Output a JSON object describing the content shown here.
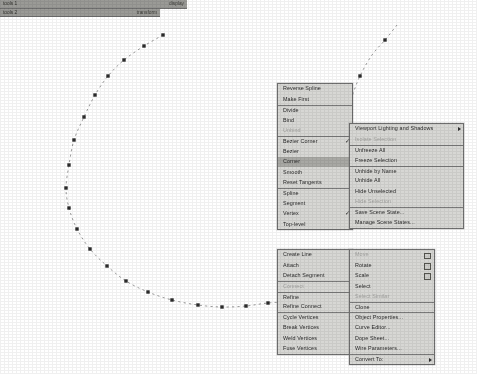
{
  "app": {
    "name": "3ds Max viewport quad menu",
    "background_color": "#ffffff",
    "menu_bg_color": "#d7d7d4",
    "menu_border_color": "#6e6e6e",
    "menu_title_bg_color": "#9a9a96",
    "highlight_color": "#a8a8a4",
    "disabled_text_color": "#a2a29f",
    "text_color": "#2a2a2a",
    "spline_color": "#8e8e8e",
    "vertex_color": "#2b2b2b"
  },
  "viewport": {
    "name": "spline-curve",
    "curve_style": "dashed",
    "vertex_count": 24,
    "vertices": [
      [
        163,
        35
      ],
      [
        144,
        46
      ],
      [
        124,
        60
      ],
      [
        108,
        76
      ],
      [
        95,
        95
      ],
      [
        84,
        117
      ],
      [
        74,
        140
      ],
      [
        69,
        165
      ],
      [
        66,
        188
      ],
      [
        69,
        208
      ],
      [
        77,
        229
      ],
      [
        90,
        249
      ],
      [
        107,
        266
      ],
      [
        126,
        281
      ],
      [
        148,
        292
      ],
      [
        172,
        300
      ],
      [
        198,
        305
      ],
      [
        222,
        307
      ],
      [
        246,
        306
      ],
      [
        268,
        303
      ],
      [
        298,
        301
      ],
      [
        330,
        298
      ],
      [
        360,
        76
      ],
      [
        367,
        55
      ]
    ],
    "upper_branch": [
      [
        397,
        25
      ],
      [
        385,
        40
      ],
      [
        372,
        55
      ],
      [
        360,
        76
      ],
      [
        352,
        97
      ],
      [
        347,
        118
      ]
    ]
  },
  "quad_menus": {
    "upper": {
      "title_left": "tools 1",
      "title_right": "display",
      "left_column": {
        "name": "tools-1-quad",
        "items": [
          {
            "label": "Reverse Spline",
            "state": "normal"
          },
          {
            "label": "Make First",
            "state": "normal"
          },
          {
            "label": "Divide",
            "state": "normal",
            "separator": true
          },
          {
            "label": "Bind",
            "state": "normal"
          },
          {
            "label": "Unbind",
            "state": "disabled"
          },
          {
            "label": "Bezier Corner",
            "state": "checked",
            "separator": true
          },
          {
            "label": "Bezier",
            "state": "normal"
          },
          {
            "label": "Corner",
            "state": "highlighted"
          },
          {
            "label": "Smooth",
            "state": "normal"
          },
          {
            "label": "Reset Tangents",
            "state": "normal"
          },
          {
            "label": "Spline",
            "state": "normal",
            "separator": true
          },
          {
            "label": "Segment",
            "state": "normal"
          },
          {
            "label": "Vertex",
            "state": "checked"
          },
          {
            "label": "Top-level",
            "state": "normal"
          }
        ]
      },
      "right_column": {
        "name": "display-quad",
        "items": [
          {
            "label": "Viewport Lighting and Shadows",
            "state": "submenu"
          },
          {
            "label": "Isolate Selection",
            "state": "disabled"
          },
          {
            "label": "Unfreeze All",
            "state": "normal",
            "separator": true
          },
          {
            "label": "Freeze Selection",
            "state": "normal"
          },
          {
            "label": "Unhide by Name",
            "state": "normal",
            "separator": true
          },
          {
            "label": "Unhide All",
            "state": "normal"
          },
          {
            "label": "Hide Unselected",
            "state": "normal"
          },
          {
            "label": "Hide Selection",
            "state": "disabled"
          },
          {
            "label": "Save Scene State...",
            "state": "normal",
            "separator": true
          },
          {
            "label": "Manage Scene States...",
            "state": "normal"
          }
        ]
      }
    },
    "lower": {
      "title_left": "tools 2",
      "title_right": "transform",
      "left_column": {
        "name": "tools-2-quad",
        "items": [
          {
            "label": "Create Line",
            "state": "normal"
          },
          {
            "label": "Attach",
            "state": "normal"
          },
          {
            "label": "Detach Segment",
            "state": "normal"
          },
          {
            "label": "Connect",
            "state": "disabled",
            "separator": true
          },
          {
            "label": "Refine",
            "state": "normal",
            "separator": true
          },
          {
            "label": "Refine Connect",
            "state": "normal"
          },
          {
            "label": "Cycle Vertices",
            "state": "normal",
            "separator": true
          },
          {
            "label": "Break Vertices",
            "state": "normal"
          },
          {
            "label": "Weld Vertices",
            "state": "normal"
          },
          {
            "label": "Fuse Vertices",
            "state": "normal"
          }
        ]
      },
      "right_column": {
        "name": "transform-quad",
        "items": [
          {
            "label": "Move",
            "state": "disabled",
            "settings": true
          },
          {
            "label": "Rotate",
            "state": "normal",
            "settings": true
          },
          {
            "label": "Scale",
            "state": "normal",
            "settings": true
          },
          {
            "label": "Select",
            "state": "normal"
          },
          {
            "label": "Select Similar",
            "state": "disabled"
          },
          {
            "label": "Clone",
            "state": "normal",
            "separator": true
          },
          {
            "label": "Object Properties...",
            "state": "normal",
            "separator": true
          },
          {
            "label": "Curve Editor...",
            "state": "normal"
          },
          {
            "label": "Dope Sheet...",
            "state": "normal"
          },
          {
            "label": "Wire Parameters...",
            "state": "normal"
          },
          {
            "label": "Convert To:",
            "state": "submenu",
            "separator": true
          }
        ]
      }
    }
  }
}
